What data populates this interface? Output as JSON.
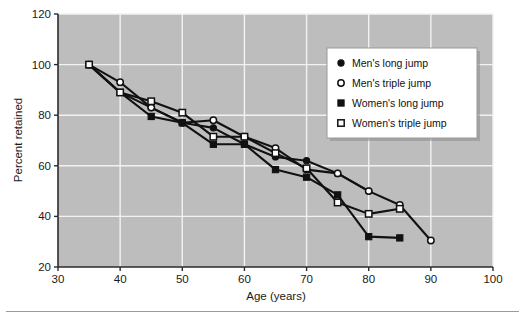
{
  "figure": {
    "background_color": "#ffffff",
    "plot_background_color": "#bdbdbd",
    "gridline_color": "#f2f2f2",
    "ink_color": "#111111"
  },
  "chart_data": {
    "type": "line",
    "title": "",
    "xlabel": "Age (years)",
    "ylabel": "Percent retained",
    "xlim": [
      30,
      100
    ],
    "ylim": [
      20,
      120
    ],
    "xticks": [
      30,
      40,
      50,
      60,
      70,
      80,
      90,
      100
    ],
    "yticks": [
      20,
      40,
      60,
      80,
      100,
      120
    ],
    "xtick_labels": [
      "30",
      "40",
      "50",
      "60",
      "70",
      "80",
      "90",
      "100"
    ],
    "ytick_labels": [
      "20",
      "40",
      "60",
      "80",
      "100",
      "120"
    ],
    "grid": true,
    "legend_position": "upper right",
    "series": [
      {
        "name": "Men's long jump",
        "marker": "filled-circle",
        "x": [
          35,
          40,
          45,
          50,
          55,
          60,
          65,
          70,
          75,
          80
        ],
        "y": [
          100,
          89,
          83,
          77,
          75,
          68.5,
          63.5,
          62,
          57,
          50
        ]
      },
      {
        "name": "Men's triple jump",
        "marker": "open-circle",
        "x": [
          35,
          40,
          45,
          50,
          55,
          60,
          65,
          70,
          75,
          80,
          85,
          90
        ],
        "y": [
          100,
          93,
          83,
          77,
          78,
          71.5,
          67,
          58.5,
          57,
          50,
          44.5,
          30.5
        ]
      },
      {
        "name": "Women's long jump",
        "marker": "filled-square",
        "x": [
          35,
          40,
          45,
          50,
          55,
          60,
          65,
          70,
          75,
          80,
          85
        ],
        "y": [
          100,
          89,
          79.5,
          77,
          68.5,
          68.5,
          58.5,
          55.5,
          48.5,
          32,
          31.5
        ]
      },
      {
        "name": "Women's triple jump",
        "marker": "open-square",
        "x": [
          35,
          40,
          45,
          50,
          55,
          60,
          65,
          70,
          75,
          80,
          85
        ],
        "y": [
          100,
          89,
          85.5,
          81,
          71.5,
          71.5,
          65,
          59,
          45.5,
          41,
          43
        ]
      }
    ]
  },
  "legend": {
    "items": [
      {
        "label": "Men's long jump",
        "marker": "filled-circle"
      },
      {
        "label": "Men's triple jump",
        "marker": "open-circle"
      },
      {
        "label": "Women's long jump",
        "marker": "filled-square"
      },
      {
        "label": "Women's triple jump",
        "marker": "open-square"
      }
    ]
  }
}
